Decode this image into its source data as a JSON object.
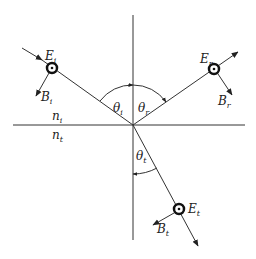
{
  "diagram": {
    "title": "",
    "colors": {
      "line": "#333333",
      "background": "#ffffff"
    },
    "media": {
      "upper": "n",
      "upper_sub": "i",
      "lower": "n",
      "lower_sub": "t"
    },
    "incident": {
      "E": "E",
      "E_sub": "i",
      "B": "B",
      "B_sub": "i",
      "angle": "θ",
      "angle_sub": "i"
    },
    "reflected": {
      "E": "E",
      "E_sub": "r",
      "B": "B",
      "B_sub": "r",
      "angle": "θ",
      "angle_sub": "r"
    },
    "transmitted": {
      "E": "E",
      "E_sub": "t",
      "B": "B",
      "B_sub": "t",
      "angle": "θ",
      "angle_sub": "t"
    }
  }
}
